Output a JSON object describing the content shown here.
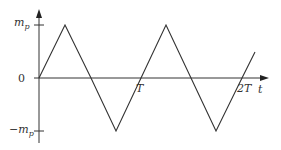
{
  "diagram": {
    "type": "triangular-waveform",
    "axes": {
      "x_label": "t",
      "y_label_top": "m",
      "y_label_top_sub": "p",
      "y_label_bottom": "−m",
      "y_label_bottom_sub": "p",
      "origin_label": "0",
      "x_ticks": [
        "T",
        "2T"
      ]
    },
    "colors": {
      "line": "#333333",
      "background": "#ffffff"
    },
    "waveform_points": [
      [
        0,
        0
      ],
      [
        0.25,
        1
      ],
      [
        0.5,
        0
      ],
      [
        0.75,
        -1
      ],
      [
        1.0,
        0
      ],
      [
        1.25,
        1
      ],
      [
        1.5,
        0
      ],
      [
        1.75,
        -1
      ],
      [
        2.0,
        0
      ],
      [
        2.1,
        0.4
      ]
    ]
  }
}
